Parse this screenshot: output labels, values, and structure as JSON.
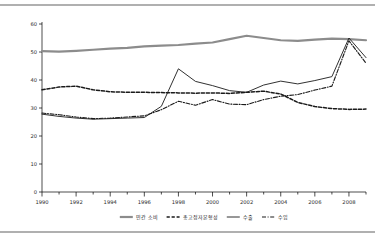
{
  "chart_data": {
    "type": "line",
    "title": "",
    "xlabel": "",
    "ylabel": "",
    "xlim": [
      1990,
      2009
    ],
    "ylim": [
      0,
      60
    ],
    "yticks": [
      0,
      10,
      20,
      30,
      40,
      50,
      60
    ],
    "xticks": [
      1990,
      1992,
      1994,
      1996,
      1998,
      2000,
      2002,
      2004,
      2006,
      2008
    ],
    "xticks_minor": [
      1991,
      1993,
      1995,
      1997,
      1999,
      2001,
      2003,
      2005,
      2007,
      2009
    ],
    "x": [
      1990,
      1991,
      1992,
      1993,
      1994,
      1995,
      1996,
      1997,
      1998,
      1999,
      2000,
      2001,
      2002,
      2003,
      2004,
      2005,
      2006,
      2007,
      2008,
      2009
    ],
    "grid": false,
    "legend_position": "bottom",
    "series": [
      {
        "name": "민간 소비",
        "style": "solid-thick",
        "color": "#8c8c8c",
        "values": [
          50.3,
          50.1,
          50.4,
          50.8,
          51.2,
          51.5,
          52.0,
          52.3,
          52.5,
          53.0,
          53.4,
          54.6,
          55.8,
          55.0,
          54.2,
          54.0,
          54.4,
          54.8,
          54.6,
          54.2
        ]
      },
      {
        "name": "총고정자본형성",
        "style": "dashed",
        "color": "#1a1a1a",
        "values": [
          36.5,
          37.5,
          37.8,
          36.5,
          35.8,
          35.6,
          35.6,
          35.5,
          35.4,
          35.3,
          35.4,
          35.2,
          35.6,
          36.0,
          35.0,
          32.0,
          30.5,
          29.8,
          29.5,
          29.6
        ]
      },
      {
        "name": "수출",
        "style": "solid-thin",
        "color": "#1a1a1a",
        "values": [
          27.8,
          27.0,
          26.4,
          26.0,
          26.2,
          26.4,
          26.6,
          30.6,
          44.0,
          39.5,
          38.0,
          36.2,
          35.6,
          38.2,
          39.6,
          38.6,
          39.8,
          41.2,
          55.0,
          48.0
        ]
      },
      {
        "name": "수입",
        "style": "dash-dot",
        "color": "#1a1a1a",
        "values": [
          28.2,
          27.6,
          26.8,
          26.2,
          26.4,
          26.8,
          27.2,
          29.4,
          32.4,
          31.0,
          33.0,
          31.4,
          31.2,
          33.0,
          34.2,
          34.8,
          36.4,
          37.8,
          54.0,
          46.0
        ]
      }
    ]
  },
  "axis": {
    "y_labels": [
      "0",
      "10",
      "20",
      "30",
      "40",
      "50",
      "60"
    ],
    "x_labels": [
      "1990",
      "1992",
      "1994",
      "1996",
      "1998",
      "2000",
      "2002",
      "2004",
      "2006",
      "2008"
    ]
  },
  "legend": {
    "items": [
      {
        "label": "민간 소비",
        "style": "solid-thick",
        "color": "#8c8c8c"
      },
      {
        "label": "총고정자본형성",
        "style": "dashed",
        "color": "#1a1a1a"
      },
      {
        "label": "수출",
        "style": "solid-thin",
        "color": "#1a1a1a"
      },
      {
        "label": "수입",
        "style": "dash-dot",
        "color": "#1a1a1a"
      }
    ]
  }
}
